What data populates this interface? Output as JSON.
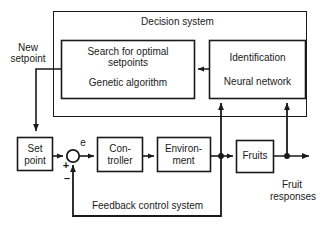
{
  "diagram": {
    "outer_block": {
      "label": "Decision system"
    },
    "blocks": [
      {
        "id": "search",
        "label_line1": "Search for optimal",
        "label_line2": "setpoints",
        "label_line3": "Genetic algorithm"
      },
      {
        "id": "identification",
        "label_line1": "Identification",
        "label_line2": "Neural network"
      },
      {
        "id": "setpoint",
        "label_line1": "Set",
        "label_line2": "point"
      },
      {
        "id": "controller",
        "label_line1": "Con-",
        "label_line2": "troller"
      },
      {
        "id": "environment",
        "label_line1": "Environ-",
        "label_line2": "ment"
      },
      {
        "id": "fruits",
        "label_line1": "Fruits"
      }
    ],
    "annotations": {
      "new_setpoint_line1": "New",
      "new_setpoint_line2": "setpoint",
      "error_signal": "e",
      "plus_sign": "+",
      "minus_sign": "–",
      "fruit_responses_line1": "Fruit",
      "fruit_responses_line2": "responses",
      "feedback_label": "Feedback control system"
    },
    "colors": {
      "stroke": "#1a1a1a",
      "background": "#ffffff",
      "text": "#1a1a1a"
    }
  }
}
